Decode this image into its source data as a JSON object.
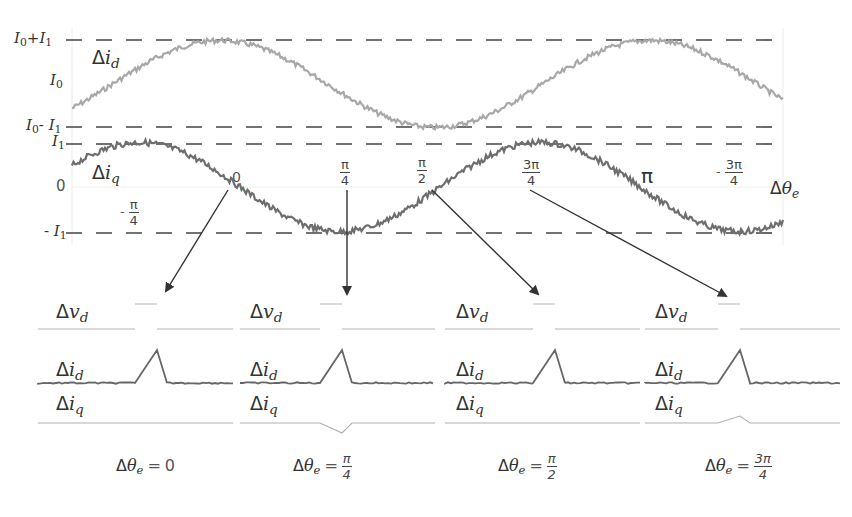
{
  "colors": {
    "background": "#ffffff",
    "id_curve": "#a8a8a8",
    "iq_curve": "#6e6e6e",
    "dashed": "#444444",
    "arrow": "#333333",
    "text": "#333333",
    "pulse_vd": "#b5b5b5",
    "pulse_id": "#666666",
    "pulse_iq": "#b0b0b0"
  },
  "top_plot": {
    "levels": [
      {
        "key": "I0_plus_I1",
        "label_main": "I",
        "label_sub1": "0",
        "label_op": "+",
        "label_main2": "I",
        "label_sub2": "1",
        "y": 40
      },
      {
        "key": "I0",
        "label_main": "I",
        "label_sub1": "0",
        "y": 84,
        "dashed": false
      },
      {
        "key": "I0_minus_I1",
        "label_main": "I",
        "label_sub1": "0",
        "label_op": "- ",
        "label_main2": "I",
        "label_sub2": "1",
        "y": 127
      },
      {
        "key": "I1",
        "label_main": "I",
        "label_sub1": "1",
        "y": 144
      },
      {
        "key": "zero",
        "label": "0",
        "y": 187,
        "dashed": false
      },
      {
        "key": "minus_I1",
        "label_prefix": "- ",
        "label_main": "I",
        "label_sub1": "1",
        "y": 233
      }
    ],
    "curve_labels": {
      "id": {
        "delta": "Δ",
        "var": "i",
        "sub": "d"
      },
      "iq": {
        "delta": "Δ",
        "var": "i",
        "sub": "q"
      },
      "theta": {
        "delta": "Δ",
        "var": "θ",
        "sub": "e"
      }
    },
    "angle_ticks": [
      {
        "sign": "- ",
        "num": "π",
        "den": "4",
        "x": 130,
        "y": 207
      },
      {
        "plain": "0",
        "x": 236,
        "y": 172
      },
      {
        "sign": "",
        "num": "π",
        "den": "4",
        "x": 340,
        "y": 160
      },
      {
        "sign": "",
        "num": "π",
        "den": "2",
        "x": 418,
        "y": 160
      },
      {
        "sign": "",
        "num": "3π",
        "den": "4",
        "x": 525,
        "y": 160
      },
      {
        "plain": "π",
        "x": 642,
        "y": 170
      },
      {
        "sign": "- ",
        "num": "3π",
        "den": "4",
        "x": 720,
        "y": 160
      }
    ]
  },
  "panels": [
    {
      "trace_labels": {
        "vd": "v",
        "vd_sub": "d",
        "id": "i",
        "id_sub": "d",
        "iq": "i",
        "iq_sub": "q",
        "delta": "Δ"
      },
      "caption": {
        "delta": "Δ",
        "var": "θ",
        "sub": "e",
        "eq": "=",
        "value_plain": "0"
      },
      "iq_response": "none"
    },
    {
      "trace_labels": {
        "vd": "v",
        "vd_sub": "d",
        "id": "i",
        "id_sub": "d",
        "iq": "i",
        "iq_sub": "q",
        "delta": "Δ"
      },
      "caption": {
        "delta": "Δ",
        "var": "θ",
        "sub": "e",
        "eq": "=",
        "num": "π",
        "den": "4"
      },
      "iq_response": "negative"
    },
    {
      "trace_labels": {
        "vd": "v",
        "vd_sub": "d",
        "id": "i",
        "id_sub": "d",
        "iq": "i",
        "iq_sub": "q",
        "delta": "Δ"
      },
      "caption": {
        "delta": "Δ",
        "var": "θ",
        "sub": "e",
        "eq": "=",
        "num": "π",
        "den": "2"
      },
      "iq_response": "none"
    },
    {
      "trace_labels": {
        "vd": "v",
        "vd_sub": "d",
        "id": "i",
        "id_sub": "d",
        "iq": "i",
        "iq_sub": "q",
        "delta": "Δ"
      },
      "caption": {
        "delta": "Δ",
        "var": "θ",
        "sub": "e",
        "eq": "=",
        "num": "3π",
        "den": "4"
      },
      "iq_response": "positive"
    }
  ]
}
